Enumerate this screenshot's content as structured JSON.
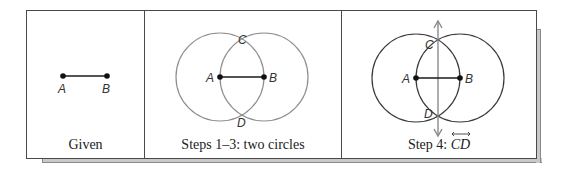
{
  "figure": {
    "colors": {
      "frame": "#4a4a4a",
      "shadow": "#c9c9c9",
      "segment": "#1a1a1a",
      "circle_light": "#8f8f8f",
      "circle_dark": "#3a3a3a",
      "line_cd": "#8a8a8a"
    },
    "panels": [
      {
        "caption": "Given",
        "points": [
          {
            "label": "A"
          },
          {
            "label": "B"
          }
        ]
      },
      {
        "caption": "Steps 1–3: two circles",
        "points": [
          {
            "label": "A"
          },
          {
            "label": "B"
          },
          {
            "label": "C"
          },
          {
            "label": "D"
          }
        ]
      },
      {
        "caption_prefix": "Step 4: ",
        "caption_line": "CD",
        "points": [
          {
            "label": "A"
          },
          {
            "label": "B"
          },
          {
            "label": "C"
          },
          {
            "label": "D"
          }
        ]
      }
    ]
  }
}
